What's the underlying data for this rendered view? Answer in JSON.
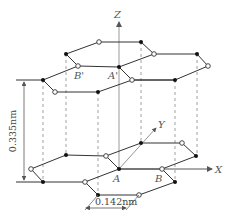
{
  "diagram": {
    "axes": {
      "x": "X",
      "y": "Y",
      "z": "Z"
    },
    "atom_labels": {
      "A": "A",
      "B": "B",
      "A_prime": "A'",
      "B_prime": "B'"
    },
    "dimensions": {
      "interlayer_spacing": "0.335nm",
      "bond_length": "0.142nm"
    },
    "colors": {
      "line": "#333333",
      "filled_atom": "#111111",
      "open_atom_fill": "#ffffff",
      "dashed": "#777777"
    },
    "top_layer": {
      "filled_atoms": [
        [
          141,
          42
        ],
        [
          197,
          54
        ],
        [
          66,
          54
        ],
        [
          119,
          67
        ],
        [
          175,
          80
        ],
        [
          43,
          80
        ],
        [
          98,
          92
        ]
      ],
      "open_atoms": [
        [
          99,
          42
        ],
        [
          154,
          54
        ],
        [
          208,
          66
        ],
        [
          78,
          66
        ],
        [
          132,
          80
        ],
        [
          55,
          92
        ]
      ]
    },
    "bottom_layer": {
      "filled_atoms": [
        [
          141,
          143
        ],
        [
          196,
          156
        ],
        [
          66,
          155
        ],
        [
          119,
          169
        ],
        [
          43,
          182
        ],
        [
          175,
          182
        ],
        [
          98,
          195
        ]
      ],
      "open_atoms": [
        [
          182,
          143
        ],
        [
          106,
          156
        ],
        [
          31,
          169
        ],
        [
          162,
          169
        ],
        [
          85,
          182
        ],
        [
          139,
          195
        ]
      ]
    }
  }
}
